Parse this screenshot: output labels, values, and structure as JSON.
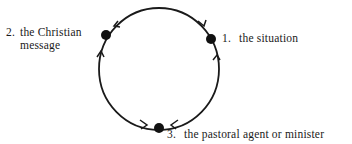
{
  "diagram": {
    "type": "cycle",
    "nodes": [
      {
        "id": "1",
        "number": "1.",
        "text": "the situation"
      },
      {
        "id": "2",
        "number": "2.",
        "text_line1": "the Christian",
        "text_line2": "message"
      },
      {
        "id": "3",
        "number": "3.",
        "text": "the pastoral agent or minister"
      }
    ],
    "edges": [
      {
        "from": "1",
        "to": "2",
        "direction": "counterclockwise-top"
      },
      {
        "from": "2",
        "to": "3",
        "direction": "left-side-up-arrow"
      },
      {
        "from": "3",
        "to": "1",
        "direction": "right-side-up-arrow"
      }
    ],
    "colors": {
      "stroke": "#1a1a1a",
      "node": "#111111"
    }
  }
}
